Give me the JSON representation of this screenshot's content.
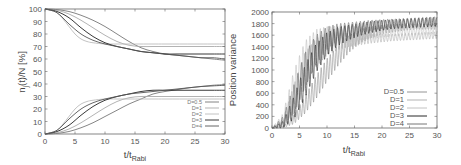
{
  "chart_data": [
    {
      "type": "line",
      "title": "",
      "xlabel": "t/t",
      "xlabel_sub": "Rabi",
      "ylabel": "n",
      "ylabel_sub": "j",
      "ylabel_rest": "(t)/N [%]",
      "xlim": [
        0,
        30
      ],
      "ylim": [
        0,
        100
      ],
      "xticks": [
        "0",
        "5",
        "10",
        "15",
        "20",
        "25",
        "30"
      ],
      "yticks": [
        "0",
        "10",
        "20",
        "30",
        "40",
        "50",
        "60",
        "70",
        "80",
        "90",
        "100"
      ],
      "grid": false,
      "legend_position": "bottom-right",
      "legend": [
        "D=0.5",
        "D=1",
        "D=2",
        "D=3",
        "D=4"
      ],
      "series": [
        {
          "name": "D=0.5",
          "color": "#777777",
          "upper": {
            "x": [
              0,
              2,
              4,
              6,
              8,
              10,
              12,
              14,
              16,
              18,
              20,
              22,
              24,
              26,
              28,
              30
            ],
            "y": [
              100,
              99.5,
              98,
              95,
              91,
              86,
              80,
              74,
              69,
              66,
              64,
              63,
              62,
              61,
              60,
              59
            ]
          },
          "lower": {
            "x": [
              0,
              2,
              4,
              6,
              8,
              10,
              12,
              14,
              16,
              18,
              20,
              22,
              24,
              26,
              28,
              30
            ],
            "y": [
              0,
              0.5,
              2,
              5,
              9,
              14,
              19,
              24,
              28,
              32,
              34,
              35.5,
              37,
              38,
              39,
              39.5
            ]
          }
        },
        {
          "name": "D=1",
          "color": "#aaaaaa",
          "upper": {
            "x": [
              0,
              2,
              4,
              6,
              8,
              10,
              12,
              14,
              16,
              18,
              20,
              22,
              24,
              26,
              28,
              30
            ],
            "y": [
              100,
              99,
              96,
              91,
              85,
              79,
              74,
              71,
              70,
              70,
              70,
              70,
              70,
              70,
              70,
              70
            ]
          },
          "lower": {
            "x": [
              0,
              2,
              4,
              6,
              8,
              10,
              12,
              14,
              16,
              18,
              20,
              22,
              24,
              26,
              28,
              30
            ],
            "y": [
              0,
              1,
              4,
              9,
              15,
              21,
              26,
              29,
              30,
              30,
              30,
              30,
              30,
              30,
              30,
              30
            ]
          }
        },
        {
          "name": "D=2",
          "color": "#bbbbbb",
          "upper": {
            "x": [
              0,
              1,
              2,
              3,
              4,
              5,
              6,
              7,
              8,
              10,
              12,
              14,
              16,
              20,
              25,
              30
            ],
            "y": [
              100,
              99,
              97,
              92,
              86,
              80,
              76,
              74,
              73,
              72,
              72,
              72,
              72,
              72,
              72,
              72
            ]
          },
          "lower": {
            "x": [
              0,
              1,
              2,
              3,
              4,
              5,
              6,
              7,
              8,
              10,
              12,
              14,
              16,
              20,
              25,
              30
            ],
            "y": [
              0,
              1,
              3,
              8,
              14,
              20,
              24,
              26,
              27,
              28,
              28,
              28,
              28,
              28,
              28,
              28
            ]
          }
        },
        {
          "name": "D=3",
          "color": "#222222",
          "upper": {
            "x": [
              0,
              2,
              4,
              6,
              8,
              10,
              12,
              14,
              16,
              18,
              20,
              22,
              24,
              26,
              28,
              30
            ],
            "y": [
              100,
              98,
              93,
              85,
              78,
              73,
              70,
              68,
              66,
              65,
              64,
              64,
              64,
              64,
              64,
              64
            ]
          },
          "lower": {
            "x": [
              0,
              2,
              4,
              6,
              8,
              10,
              12,
              14,
              16,
              18,
              20,
              22,
              24,
              26,
              28,
              30
            ],
            "y": [
              0,
              2,
              7,
              15,
              22,
              27,
              30,
              32,
              34,
              35,
              35,
              35,
              35,
              35,
              35,
              35
            ]
          }
        },
        {
          "name": "D=4",
          "color": "#555555",
          "upper": {
            "x": [
              0,
              2,
              4,
              6,
              8,
              10,
              12,
              14,
              16,
              18,
              20,
              22,
              24,
              26,
              28,
              30
            ],
            "y": [
              100,
              97,
              88,
              80,
              75,
              72,
              70,
              68,
              66,
              65,
              64,
              63,
              62,
              61,
              61,
              60
            ]
          },
          "lower": {
            "x": [
              0,
              2,
              4,
              6,
              8,
              10,
              12,
              14,
              16,
              18,
              20,
              22,
              24,
              26,
              28,
              30
            ],
            "y": [
              0,
              3,
              12,
              20,
              25,
              28,
              30,
              32,
              33,
              34,
              35,
              36,
              37,
              38,
              38.5,
              39
            ]
          }
        }
      ]
    },
    {
      "type": "line",
      "title": "",
      "xlabel": "t/t",
      "xlabel_sub": "Rabi",
      "ylabel": "Position variance",
      "xlim": [
        0,
        30
      ],
      "ylim": [
        0,
        2000
      ],
      "xticks": [
        "0",
        "5",
        "10",
        "15",
        "20",
        "25",
        "30"
      ],
      "yticks": [
        "0",
        "200",
        "400",
        "600",
        "800",
        "1000",
        "1200",
        "1400",
        "1600",
        "1800",
        "2000"
      ],
      "grid": false,
      "legend_position": "bottom-right",
      "legend": [
        "D=0.5",
        "D=1",
        "D=2",
        "D=3",
        "D=4"
      ],
      "series": [
        {
          "name": "D=0.5",
          "color": "#888888",
          "x": [
            0,
            2,
            4,
            6,
            8,
            10,
            12,
            14,
            16,
            18,
            20,
            22,
            24,
            26,
            28,
            30
          ],
          "y_mean": [
            0,
            20,
            150,
            400,
            700,
            1000,
            1250,
            1450,
            1580,
            1650,
            1700,
            1720,
            1740,
            1750,
            1750,
            1750
          ],
          "amplitude": [
            0,
            20,
            80,
            150,
            200,
            200,
            180,
            150,
            120,
            100,
            80,
            70,
            60,
            50,
            50,
            50
          ]
        },
        {
          "name": "D=1",
          "color": "#aaaaaa",
          "x": [
            0,
            2,
            4,
            6,
            8,
            10,
            12,
            14,
            16,
            18,
            20,
            22,
            24,
            26,
            28,
            30
          ],
          "y_mean": [
            0,
            80,
            500,
            1000,
            1300,
            1450,
            1500,
            1520,
            1530,
            1540,
            1550,
            1560,
            1570,
            1580,
            1590,
            1600
          ],
          "amplitude": [
            0,
            80,
            250,
            300,
            250,
            200,
            150,
            120,
            100,
            80,
            70,
            60,
            60,
            60,
            60,
            60
          ]
        },
        {
          "name": "D=2",
          "color": "#bbbbbb",
          "x": [
            0,
            2,
            4,
            6,
            8,
            10,
            12,
            14,
            16,
            18,
            20,
            22,
            24,
            26,
            28,
            30
          ],
          "y_mean": [
            0,
            150,
            700,
            1200,
            1450,
            1550,
            1600,
            1620,
            1630,
            1640,
            1650,
            1660,
            1670,
            1680,
            1690,
            1700
          ],
          "amplitude": [
            0,
            100,
            300,
            300,
            250,
            200,
            160,
            140,
            120,
            100,
            90,
            80,
            80,
            80,
            80,
            80
          ]
        },
        {
          "name": "D=3",
          "color": "#111111",
          "x": [
            0,
            2,
            4,
            6,
            8,
            10,
            12,
            14,
            16,
            18,
            20,
            22,
            24,
            26,
            28,
            30
          ],
          "y_mean": [
            0,
            60,
            350,
            800,
            1200,
            1450,
            1580,
            1650,
            1700,
            1740,
            1770,
            1790,
            1800,
            1810,
            1820,
            1830
          ],
          "amplitude": [
            0,
            60,
            200,
            280,
            250,
            200,
            160,
            130,
            110,
            100,
            90,
            80,
            80,
            80,
            80,
            80
          ]
        },
        {
          "name": "D=4",
          "color": "#666666",
          "x": [
            0,
            2,
            4,
            6,
            8,
            10,
            12,
            14,
            16,
            18,
            20,
            22,
            24,
            26,
            28,
            30
          ],
          "y_mean": [
            0,
            120,
            500,
            1000,
            1350,
            1550,
            1650,
            1700,
            1740,
            1770,
            1790,
            1810,
            1820,
            1830,
            1840,
            1850
          ],
          "amplitude": [
            0,
            80,
            250,
            300,
            250,
            200,
            150,
            120,
            100,
            90,
            80,
            70,
            70,
            70,
            70,
            70
          ]
        }
      ]
    }
  ]
}
